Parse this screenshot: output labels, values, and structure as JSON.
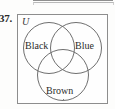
{
  "exercise": {
    "number": "37."
  },
  "figure": {
    "universe_label": "U",
    "circles": [
      {
        "name": "black",
        "label": "Black"
      },
      {
        "name": "blue",
        "label": "Blue"
      },
      {
        "name": "brown",
        "label": "Brown"
      }
    ],
    "colors": {
      "outline": "#6f6f6f",
      "box_border": "#8d8d8d",
      "text": "#2b2b2b",
      "background": "#fefefe"
    }
  },
  "chart_data": {
    "type": "venn",
    "title": "",
    "universe": "U",
    "sets": [
      "Black",
      "Blue",
      "Brown"
    ],
    "layout": "three-circle symmetric (two top, one bottom)",
    "regions": [
      "Black only",
      "Blue only",
      "Brown only",
      "Black and Blue",
      "Black and Brown",
      "Blue and Brown",
      "Black and Blue and Brown",
      "outside all sets (within U)"
    ],
    "values": [],
    "legend": "none",
    "grid": false
  }
}
